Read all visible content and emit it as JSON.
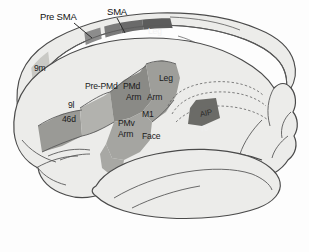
{
  "figure": {
    "kind": "anatomical-diagram",
    "background_color": "#fdfdfd",
    "outline_color": "#4a4a4a",
    "cortex_fill": "#ececea"
  },
  "leader_labels": [
    {
      "id": "pre-sma",
      "text": "Pre SMA",
      "x": 40,
      "y": 12
    },
    {
      "id": "sma",
      "text": "SMA",
      "x": 107,
      "y": 7
    }
  ],
  "region_labels": [
    {
      "id": "leg-medial",
      "text": "Leg",
      "x": 148,
      "y": 27
    },
    {
      "id": "9m",
      "text": "9m",
      "x": 34,
      "y": 64
    },
    {
      "id": "pre-pmd",
      "text": "Pre-PMd",
      "x": 85,
      "y": 82
    },
    {
      "id": "pmd",
      "text": "PMd",
      "x": 123,
      "y": 82
    },
    {
      "id": "pmd-arm",
      "text": "Arm",
      "x": 126,
      "y": 93
    },
    {
      "id": "m1-arm",
      "text": "Arm",
      "x": 147,
      "y": 93
    },
    {
      "id": "leg-lateral",
      "text": "Leg",
      "x": 159,
      "y": 74
    },
    {
      "id": "m1",
      "text": "M1",
      "x": 142,
      "y": 110
    },
    {
      "id": "9l",
      "text": "9l",
      "x": 68,
      "y": 101
    },
    {
      "id": "46d",
      "text": "46d",
      "x": 62,
      "y": 115
    },
    {
      "id": "pmv",
      "text": "PMv",
      "x": 118,
      "y": 119
    },
    {
      "id": "pmv-arm",
      "text": "Arm",
      "x": 118,
      "y": 130
    },
    {
      "id": "face",
      "text": "Face",
      "x": 142,
      "y": 132
    },
    {
      "id": "aip",
      "text": "AIP",
      "x": 200,
      "y": 111
    },
    {
      "id": "7b",
      "text": "7b",
      "x": 200,
      "y": 126
    }
  ],
  "shaded_regions": [
    {
      "id": "sma-medial-band",
      "label": "SMA",
      "color": "#6e6e6e"
    },
    {
      "id": "pre-sma-medial-band",
      "label": "Pre SMA",
      "color": "#8c8c8c"
    },
    {
      "id": "leg-medial-band",
      "label": "Leg",
      "color": "#5c5c5c"
    },
    {
      "id": "9m-band",
      "label": "9m",
      "color": "#c9c9c5"
    },
    {
      "id": "9l-46d-band",
      "label": "9l / 46d",
      "color": "#9a9a96"
    },
    {
      "id": "pre-pmd-band",
      "label": "Pre-PMd",
      "color": "#b2b2ae"
    },
    {
      "id": "pmd-band",
      "label": "PMd Arm",
      "color": "#8a8a86"
    },
    {
      "id": "m1-band",
      "label": "M1",
      "color": "#9e9e9a"
    },
    {
      "id": "pmv-band",
      "label": "PMv Arm",
      "color": "#a5a5a1"
    },
    {
      "id": "aip-7b-patch",
      "label": "AIP / 7b",
      "color": "#6b6b67"
    }
  ]
}
